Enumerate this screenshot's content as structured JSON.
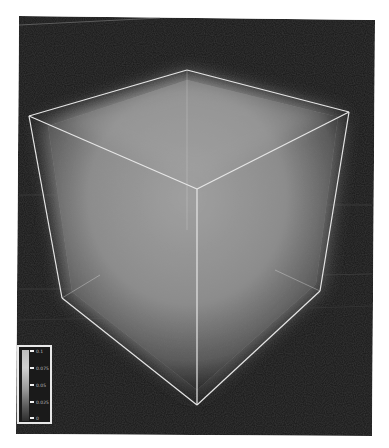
{
  "scene": {
    "type": "3d-volume-rendering",
    "background_color": "#151515",
    "volume_color": "#8e8e8e",
    "wireframe_color": "#e6e6e6",
    "render_area": {
      "x": 17,
      "y": 16,
      "width": 356,
      "height": 420
    },
    "cube_vertices": {
      "top_left": [
        29,
        116
      ],
      "top_back": [
        187,
        70
      ],
      "top_right": [
        349,
        112
      ],
      "top_front": [
        197,
        189
      ],
      "bottom_left": [
        62,
        298
      ],
      "bottom_front": [
        197,
        405
      ],
      "bottom_right": [
        320,
        291
      ]
    }
  },
  "colorbar": {
    "labels": [
      "0.1",
      "0.075",
      "0.05",
      "0.025",
      "0"
    ],
    "top_color": "#cfcfcf",
    "bottom_color": "#2e2e2e"
  }
}
